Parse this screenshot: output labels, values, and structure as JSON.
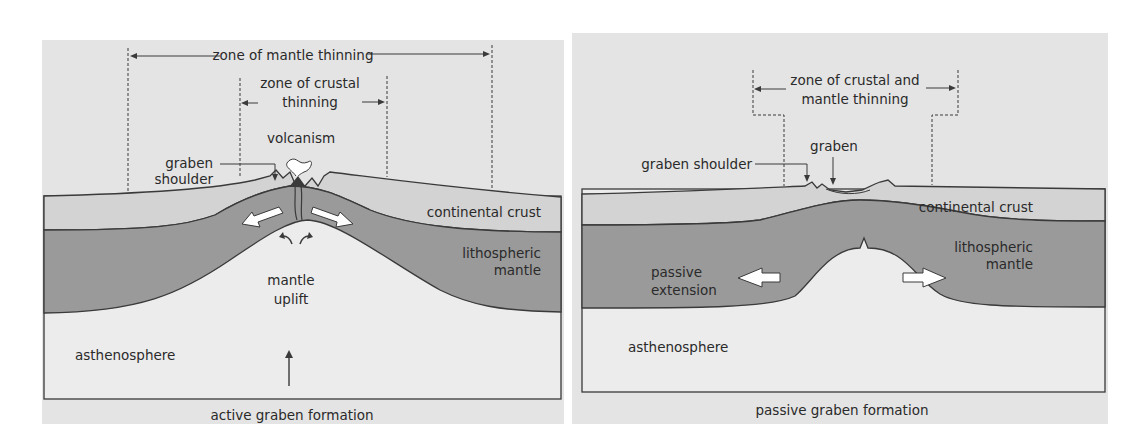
{
  "colors": {
    "background": "#e4e4e4",
    "crust": "#d3d3d3",
    "mantle": "#9a9a9a",
    "asthenosphere": "#e9e9e9",
    "outline": "#3a3a3a",
    "arrow_fill": "#ffffff"
  },
  "active": {
    "zone_mantle_label": "zone of mantle thinning",
    "zone_crustal_label_line1": "zone of crustal",
    "zone_crustal_label_line2": "thinning",
    "volcanism_label": "volcanism",
    "graben_shoulder_line1": "graben",
    "graben_shoulder_line2": "shoulder",
    "crust_label": "continental crust",
    "mantle_label_line1": "lithospheric",
    "mantle_label_line2": "mantle",
    "uplift_label_line1": "mantle",
    "uplift_label_line2": "uplift",
    "asthenosphere_label": "asthenosphere",
    "caption": "active graben formation"
  },
  "passive": {
    "zone_label_line1": "zone of crustal and",
    "zone_label_line2": "mantle thinning",
    "graben_label": "graben",
    "graben_shoulder_label": "graben shoulder",
    "crust_label": "continental crust",
    "mantle_label_line1": "lithospheric",
    "mantle_label_line2": "mantle",
    "extension_label_line1": "passive",
    "extension_label_line2": "extension",
    "asthenosphere_label": "asthenosphere",
    "caption": "passive graben formation"
  }
}
